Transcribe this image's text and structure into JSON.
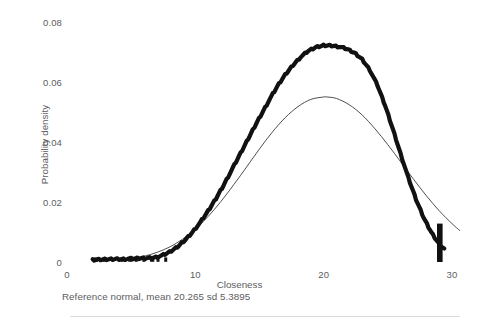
{
  "figure": {
    "background_color": "#ffffff",
    "text_color": "#5d5d5f",
    "caption": "Reference normal, mean 20.265 sd 5.3895",
    "bottom_rule_color": "#d0d0d2"
  },
  "axes": {
    "x": {
      "label": "Closeness",
      "ticks": [
        {
          "value": 0,
          "label": "0"
        },
        {
          "value": 10,
          "label": "10"
        },
        {
          "value": 20,
          "label": "20"
        },
        {
          "value": 30,
          "label": "30"
        }
      ],
      "range": [
        0,
        31.2
      ]
    },
    "y": {
      "label": "Probability density",
      "ticks": [
        {
          "value": 0,
          "label": "0"
        },
        {
          "value": 0.02,
          "label": "0.02"
        },
        {
          "value": 0.04,
          "label": "0.04"
        },
        {
          "value": 0.06,
          "label": "0.06"
        },
        {
          "value": 0.08,
          "label": "0.08"
        }
      ],
      "range": [
        0,
        0.0855
      ]
    },
    "grid": false
  },
  "chart_data": {
    "type": "line",
    "title": "",
    "xlabel": "Closeness",
    "ylabel": "Probability density",
    "xlim": [
      0,
      31.2
    ],
    "ylim": [
      0,
      0.0855
    ],
    "grid": false,
    "legend": "none",
    "annotations": [
      "Reference normal, mean 20.265 sd 5.3895"
    ],
    "series": [
      {
        "name": "Empirical density (Closeness)",
        "style": "thick-black-jagged",
        "color": "#111111",
        "line_width": 4.2,
        "x": [
          2.0,
          2.6,
          3.2,
          3.8,
          4.4,
          5.0,
          5.6,
          6.2,
          6.8,
          7.4,
          8.0,
          8.6,
          9.2,
          9.8,
          10.4,
          11.0,
          11.6,
          12.2,
          12.8,
          13.4,
          14.0,
          14.6,
          15.2,
          15.8,
          16.4,
          17.0,
          17.6,
          18.2,
          18.8,
          19.4,
          20.0,
          20.6,
          21.2,
          21.8,
          22.4,
          23.0,
          23.6,
          24.2,
          24.8,
          25.4,
          26.0,
          26.6,
          27.2,
          27.8,
          28.4,
          29.0,
          29.4
        ],
        "y": [
          0.0006,
          0.0008,
          0.0009,
          0.001,
          0.001,
          0.0011,
          0.0012,
          0.0013,
          0.0015,
          0.0021,
          0.0033,
          0.005,
          0.0073,
          0.0101,
          0.0133,
          0.017,
          0.0211,
          0.0256,
          0.0304,
          0.0352,
          0.0401,
          0.045,
          0.0497,
          0.0543,
          0.0586,
          0.0624,
          0.0656,
          0.0683,
          0.0703,
          0.0716,
          0.0722,
          0.0722,
          0.0718,
          0.071,
          0.0697,
          0.0676,
          0.064,
          0.0588,
          0.052,
          0.0442,
          0.036,
          0.028,
          0.0208,
          0.0147,
          0.0098,
          0.006,
          0.0042
        ]
      },
      {
        "name": "Reference normal, mean 20.265 sd 5.3895",
        "style": "thin-black-smooth",
        "color": "#222222",
        "line_width": 0.8,
        "mean": 20.265,
        "sd": 5.3895,
        "x": [
          4.0,
          5.0,
          6.0,
          7.0,
          8.0,
          9.0,
          10.0,
          11.0,
          12.0,
          13.0,
          14.0,
          15.0,
          16.0,
          17.0,
          18.0,
          19.0,
          20.0,
          20.265,
          21.0,
          22.0,
          23.0,
          24.0,
          25.0,
          26.0,
          27.0,
          28.0,
          29.0,
          30.0,
          30.6
        ],
        "y": [
          0.0006,
          0.0011,
          0.0019,
          0.0032,
          0.005,
          0.0076,
          0.011,
          0.0152,
          0.0202,
          0.0258,
          0.0317,
          0.0377,
          0.0433,
          0.0481,
          0.0518,
          0.0542,
          0.055,
          0.055,
          0.0545,
          0.0524,
          0.049,
          0.0444,
          0.0391,
          0.0334,
          0.0276,
          0.0221,
          0.0171,
          0.0128,
          0.0105
        ]
      }
    ],
    "rug_marks": {
      "name": "baseline-rug",
      "x": [
        2.2,
        2.9,
        4.3,
        4.9,
        5.4,
        6.0,
        6.6,
        7.1,
        7.7
      ],
      "y": 0.0008
    },
    "spike": {
      "name": "right-tail-spike",
      "x": 29.05,
      "y_top": 0.0128,
      "y_bottom": 0.0
    }
  }
}
